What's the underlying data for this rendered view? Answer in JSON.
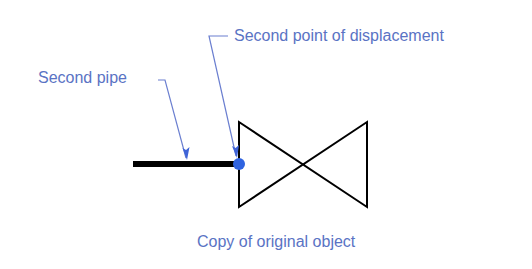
{
  "diagram": {
    "labels": {
      "second_point_of_displacement": "Second point of displacement",
      "second_pipe": "Second pipe",
      "copy_of_original_object": "Copy of original object"
    },
    "colors": {
      "annotation_text": "#5a73c4",
      "leader_line": "#6b7fd0",
      "arrow_head": "#3f64d8",
      "point_marker": "#2f63e0",
      "geometry": "#000000",
      "background": "#ffffff"
    },
    "elements": {
      "pipe": "thick horizontal line",
      "valve_symbol": "bowtie (two triangles meeting at a point)",
      "displacement_point": "filled circle at pipe/valve junction"
    }
  }
}
